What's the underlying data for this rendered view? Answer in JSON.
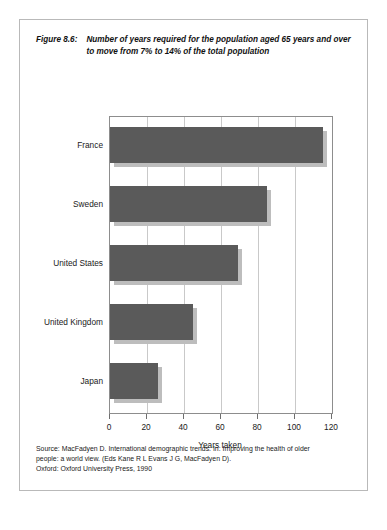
{
  "figure": {
    "number": "Figure 8.6:",
    "title": "Number of years required for the population aged 65 years and over to move from 7% to 14% of the total population"
  },
  "source": {
    "line1": "Source: MacFadyen D. International demographic trends. In: Improving the health of older",
    "line2": "people: a world view. (Eds Kane R L Evans J G, MacFadyen D).",
    "line3": "Oxford: Oxford University Press, 1990"
  },
  "colors": {
    "bar": "#5a5a5a",
    "bar_shadow": "#bdbdbd",
    "gridline": "#c9c9c9",
    "frame": "#8d8d8d",
    "border": "#b9b9b9",
    "text": "#1a1a1a"
  },
  "chart_data": {
    "type": "bar",
    "orientation": "horizontal",
    "title": "Number of years required for the population aged 65 years and over to move from 7% to 14% of the total population",
    "categories": [
      "France",
      "Sweden",
      "United States",
      "United Kingdom",
      "Japan"
    ],
    "values": [
      115,
      85,
      69,
      45,
      26
    ],
    "xlabel": "Years taken",
    "ylabel": "",
    "xlim": [
      0,
      120
    ],
    "xticks": [
      0,
      20,
      40,
      60,
      80,
      100,
      120
    ],
    "xtick_labels": [
      "0",
      "20",
      "40",
      "60",
      "80",
      "100",
      "120"
    ],
    "grid": "vertical",
    "legend": "none",
    "series": [
      {
        "name": "Years taken",
        "values": [
          115,
          85,
          69,
          45,
          26
        ]
      }
    ]
  }
}
